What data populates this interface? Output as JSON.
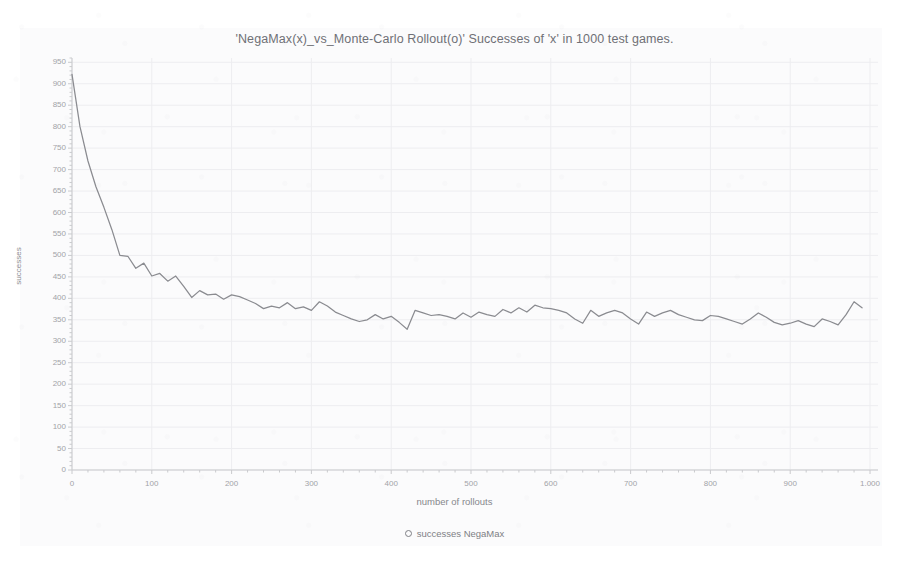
{
  "chart_data": {
    "type": "line",
    "title": "'NegaMax(x)_vs_Monte-Carlo Rollout(o)'  Successes of 'x' in 1000 test games.",
    "xlabel": "number of rollouts",
    "ylabel": "successes",
    "xlim": [
      0,
      1010
    ],
    "ylim": [
      0,
      960
    ],
    "grid": true,
    "legend_position": "bottom-center",
    "series": [
      {
        "name": "successes NegaMax",
        "marker": "circle-outline",
        "color": "#8a8b90",
        "x": [
          0,
          10,
          20,
          30,
          40,
          50,
          60,
          70,
          80,
          90,
          100,
          110,
          120,
          130,
          140,
          150,
          160,
          170,
          180,
          190,
          200,
          210,
          220,
          230,
          240,
          250,
          260,
          270,
          280,
          290,
          300,
          310,
          320,
          330,
          340,
          350,
          360,
          370,
          380,
          390,
          400,
          410,
          420,
          430,
          440,
          450,
          460,
          470,
          480,
          490,
          500,
          510,
          520,
          530,
          540,
          550,
          560,
          570,
          580,
          590,
          600,
          610,
          620,
          630,
          640,
          650,
          660,
          670,
          680,
          690,
          700,
          710,
          720,
          730,
          740,
          750,
          760,
          770,
          780,
          790,
          800,
          810,
          820,
          830,
          840,
          850,
          860,
          870,
          880,
          890,
          900,
          910,
          920,
          930,
          940,
          950,
          960,
          970,
          980,
          990
        ],
        "values": [
          922,
          800,
          720,
          660,
          612,
          560,
          500,
          498,
          470,
          482,
          452,
          458,
          440,
          452,
          428,
          402,
          418,
          408,
          410,
          398,
          408,
          404,
          396,
          388,
          376,
          382,
          378,
          390,
          376,
          380,
          372,
          392,
          382,
          368,
          360,
          352,
          346,
          350,
          362,
          352,
          358,
          344,
          328,
          372,
          366,
          360,
          362,
          358,
          352,
          366,
          356,
          368,
          362,
          358,
          374,
          366,
          378,
          368,
          384,
          378,
          376,
          372,
          366,
          352,
          342,
          372,
          358,
          366,
          372,
          366,
          352,
          340,
          368,
          358,
          366,
          372,
          362,
          356,
          350,
          348,
          360,
          358,
          352,
          346,
          340,
          352,
          366,
          356,
          344,
          338,
          342,
          348,
          340,
          334,
          352,
          346,
          338,
          362,
          392,
          378
        ]
      }
    ],
    "yticks": [
      0,
      50,
      100,
      150,
      200,
      250,
      300,
      350,
      400,
      450,
      500,
      550,
      600,
      650,
      700,
      750,
      800,
      850,
      900,
      950
    ],
    "ytick_labels": [
      "0",
      "50",
      "100",
      "150",
      "200",
      "250",
      "300",
      "350",
      "400",
      "450",
      "500",
      "550",
      "600",
      "650",
      "700",
      "750",
      "800",
      "850",
      "900",
      "950"
    ],
    "xticks": [
      0,
      100,
      200,
      300,
      400,
      500,
      600,
      700,
      800,
      900,
      1000
    ],
    "xtick_labels": [
      "0",
      "100",
      "200",
      "300",
      "400",
      "500",
      "600",
      "700",
      "800",
      "900",
      "1.000"
    ],
    "colors": {
      "line": "#8a8b90",
      "grid": "#ededf0",
      "axis": "#c9cacd",
      "text": "#a2a3a8",
      "title": "#6f7076",
      "background": "#fbfbfc"
    }
  },
  "legend": {
    "entry_label": "successes NegaMax"
  }
}
